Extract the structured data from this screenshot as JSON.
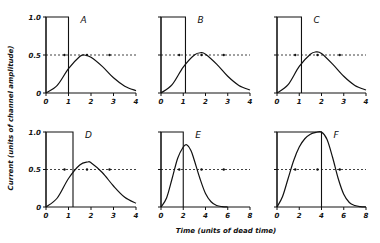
{
  "chart_data": {
    "type": "line",
    "title": "",
    "ylabel": "Current (units of channel amplitude)",
    "xlabel": "Time (units of dead time)",
    "grid": false,
    "layout": "2x3 panels",
    "panels": [
      {
        "label": "A",
        "xlim": [
          0,
          4
        ],
        "xticks": [
          "0",
          "1",
          "2",
          "3",
          "4"
        ],
        "ylim": [
          0,
          1.0
        ],
        "yticks": [
          "0",
          "0.5",
          "1.0"
        ],
        "pulse": {
          "start": 0,
          "end": 1.0,
          "amplitude": 1.0
        },
        "response": {
          "x": [
            0,
            0.5,
            1.0,
            1.5,
            1.7,
            2.0,
            2.5,
            3.0,
            3.5,
            4.0
          ],
          "y": [
            0,
            0.1,
            0.32,
            0.48,
            0.5,
            0.47,
            0.35,
            0.2,
            0.09,
            0.03
          ]
        },
        "half_line": 0.5
      },
      {
        "label": "B",
        "xlim": [
          0,
          4
        ],
        "xticks": [
          "0",
          "1",
          "2",
          "3",
          "4"
        ],
        "ylim": [
          0,
          1.0
        ],
        "pulse": {
          "start": 0,
          "end": 1.1,
          "amplitude": 1.0
        },
        "response": {
          "x": [
            0,
            0.5,
            1.0,
            1.5,
            1.8,
            2.0,
            2.5,
            3.0,
            3.5,
            4.0
          ],
          "y": [
            0,
            0.11,
            0.34,
            0.5,
            0.53,
            0.51,
            0.38,
            0.22,
            0.1,
            0.04
          ]
        },
        "half_line": 0.5
      },
      {
        "label": "C",
        "xlim": [
          0,
          4
        ],
        "xticks": [
          "0",
          "1",
          "2",
          "3",
          "4"
        ],
        "ylim": [
          0,
          1.0
        ],
        "pulse": {
          "start": 0,
          "end": 1.1,
          "amplitude": 1.0
        },
        "response": {
          "x": [
            0,
            0.5,
            1.0,
            1.5,
            1.75,
            2.0,
            2.5,
            3.0,
            3.5,
            4.0
          ],
          "y": [
            0,
            0.11,
            0.35,
            0.51,
            0.54,
            0.52,
            0.38,
            0.22,
            0.1,
            0.04
          ]
        },
        "half_line": 0.5
      },
      {
        "label": "D",
        "xlim": [
          0,
          4
        ],
        "xticks": [
          "0",
          "1",
          "2",
          "3",
          "4"
        ],
        "ylim": [
          0,
          1.0
        ],
        "yticks": [
          "0",
          "0.5",
          "1.0"
        ],
        "pulse": {
          "start": 0,
          "end": 1.2,
          "amplitude": 1.0
        },
        "response": {
          "x": [
            0,
            0.5,
            1.0,
            1.5,
            1.85,
            2.0,
            2.5,
            3.0,
            3.5,
            4.0
          ],
          "y": [
            0,
            0.12,
            0.38,
            0.56,
            0.6,
            0.59,
            0.46,
            0.28,
            0.13,
            0.05
          ]
        },
        "half_line": 0.5
      },
      {
        "label": "E",
        "xlim": [
          0,
          8
        ],
        "xticks": [
          "0",
          "2",
          "4",
          "6",
          "8"
        ],
        "ylim": [
          0,
          1.0
        ],
        "pulse": {
          "start": 0,
          "end": 2.0,
          "amplitude": 1.0
        },
        "response": {
          "x": [
            0,
            0.5,
            1.0,
            1.5,
            2.0,
            2.3,
            2.7,
            3.0,
            3.5,
            4.0,
            4.5,
            5.0,
            5.5,
            6.0
          ],
          "y": [
            0,
            0.12,
            0.38,
            0.65,
            0.8,
            0.83,
            0.75,
            0.62,
            0.38,
            0.18,
            0.07,
            0.02,
            0.005,
            0
          ]
        },
        "half_line": 0.5
      },
      {
        "label": "F",
        "xlim": [
          0,
          8
        ],
        "xticks": [
          "0",
          "2",
          "4",
          "6",
          "8"
        ],
        "ylim": [
          0,
          1.0
        ],
        "pulse": {
          "start": 0,
          "end": 4.0,
          "amplitude": 1.0
        },
        "response": {
          "x": [
            0,
            0.5,
            1.0,
            1.5,
            2.0,
            2.5,
            3.0,
            3.5,
            4.0,
            4.5,
            5.0,
            5.5,
            6.0,
            6.5,
            7.0,
            7.5,
            8.0
          ],
          "y": [
            0,
            0.14,
            0.38,
            0.62,
            0.8,
            0.91,
            0.97,
            0.995,
            1.0,
            0.9,
            0.66,
            0.38,
            0.17,
            0.06,
            0.02,
            0.005,
            0
          ]
        },
        "half_line": 0.5
      }
    ]
  },
  "labels": {
    "ylabel": "Current (units of channel amplitude)",
    "xlabel": "Time (units of dead time)"
  }
}
